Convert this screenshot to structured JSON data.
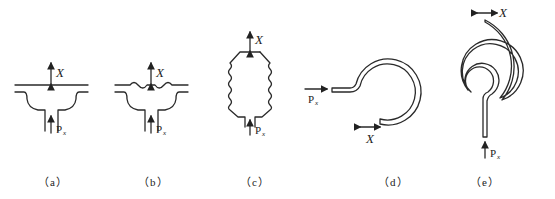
{
  "figure": {
    "panels": [
      {
        "id": "a",
        "caption": "（a）",
        "element": "flat diaphragm",
        "output_label": "X",
        "input_label": "P",
        "input_sub": "x"
      },
      {
        "id": "b",
        "caption": "（b）",
        "element": "corrugated diaphragm",
        "output_label": "X",
        "input_label": "P",
        "input_sub": "x"
      },
      {
        "id": "c",
        "caption": "（c）",
        "element": "bellows",
        "output_label": "X",
        "input_label": "P",
        "input_sub": "x"
      },
      {
        "id": "d",
        "caption": "（d）",
        "element": "C-shaped Bourdon tube",
        "output_label": "X",
        "input_label": "P",
        "input_sub": "x"
      },
      {
        "id": "e",
        "caption": "（e）",
        "element": "spiral Bourdon tube",
        "output_label": "X",
        "input_label": "P",
        "input_sub": "x"
      }
    ]
  }
}
